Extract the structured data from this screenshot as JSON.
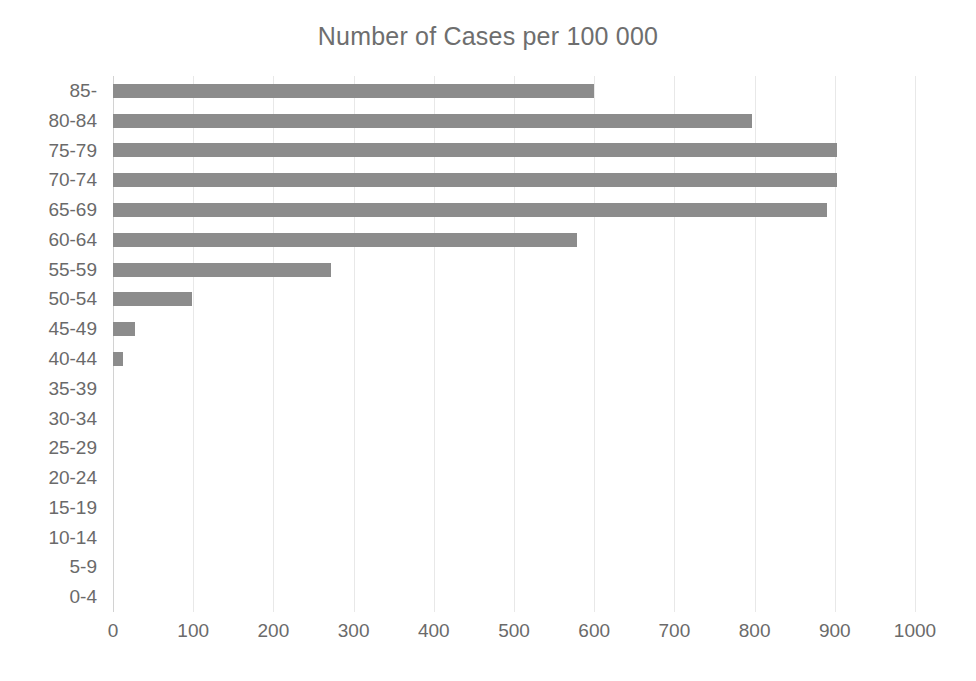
{
  "chart_data": {
    "type": "bar",
    "orientation": "horizontal",
    "title": "Number of Cases per 100 000",
    "xlabel": "",
    "ylabel": "",
    "xlim": [
      0,
      1000
    ],
    "ylim": null,
    "grid": true,
    "legend": null,
    "bar_color": "#8c8c8c",
    "text_color": "#6a6a6a",
    "gridline_color": "#e8e8e8",
    "xticks": [
      0,
      100,
      200,
      300,
      400,
      500,
      600,
      700,
      800,
      900,
      1000
    ],
    "xtick_labels": [
      "0",
      "100",
      "200",
      "300",
      "400",
      "500",
      "600",
      "700",
      "800",
      "900",
      "1000"
    ],
    "categories": [
      "85-",
      "80-84",
      "75-79",
      "70-74",
      "65-69",
      "60-64",
      "55-59",
      "50-54",
      "45-49",
      "40-44",
      "35-39",
      "30-34",
      "25-29",
      "20-24",
      "15-19",
      "10-14",
      "5-9",
      "0-4"
    ],
    "values": [
      600,
      797,
      903,
      903,
      890,
      578,
      272,
      98,
      28,
      12,
      0,
      0,
      0,
      0,
      0,
      0,
      0,
      0
    ]
  }
}
